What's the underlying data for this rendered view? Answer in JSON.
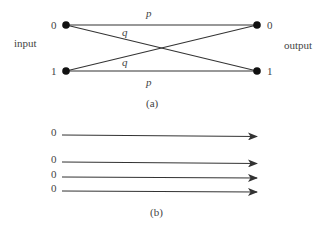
{
  "figure_a": {
    "caption": "(a)",
    "side_labels": {
      "input": "input",
      "output": "output"
    },
    "input_nodes": [
      {
        "label": "0"
      },
      {
        "label": "1"
      }
    ],
    "output_nodes": [
      {
        "label": "0"
      },
      {
        "label": "1"
      }
    ],
    "edges": [
      {
        "from": "0",
        "to": "0",
        "label": "p"
      },
      {
        "from": "0",
        "to": "1",
        "label": "q"
      },
      {
        "from": "1",
        "to": "0",
        "label": "q"
      },
      {
        "from": "1",
        "to": "1",
        "label": "p"
      }
    ],
    "colors": {
      "line": "#333333",
      "node": "#111111"
    }
  },
  "figure_b": {
    "caption": "(b)",
    "arrows": [
      {
        "label": "0"
      },
      {
        "label": "0"
      },
      {
        "label": "0"
      },
      {
        "label": "0"
      }
    ]
  }
}
